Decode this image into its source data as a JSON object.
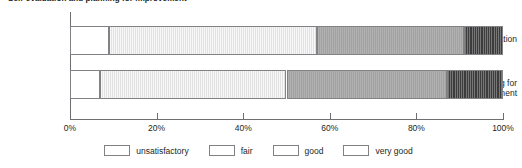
{
  "title_clipped": "Self-evaluation and planning for improvement",
  "axis": {
    "tick_labels": [
      "0%",
      "20%",
      "40%",
      "60%",
      "80%",
      "100%"
    ],
    "tick_values": [
      0,
      20,
      40,
      60,
      80,
      100
    ]
  },
  "legend": {
    "items": [
      {
        "label": "unsatisfactory",
        "key": "sw-unsatisfactory",
        "color": "#ffffff"
      },
      {
        "label": "fair",
        "key": "sw-fair",
        "color": "#e2e2e2"
      },
      {
        "label": "good",
        "key": "sw-good",
        "color": "#a2a2a2"
      },
      {
        "label": "very good",
        "key": "sw-verygood",
        "color": "#3c3c3c"
      }
    ]
  },
  "chart_data": {
    "type": "bar",
    "orientation": "horizontal",
    "stacked": true,
    "normalized_percent": true,
    "title": "Self-evaluation and planning for improvement",
    "xlabel": "",
    "ylabel": "",
    "xlim": [
      0,
      100
    ],
    "xticks": [
      0,
      20,
      40,
      60,
      80,
      100
    ],
    "xtick_labels": [
      "0%",
      "20%",
      "40%",
      "60%",
      "80%",
      "100%"
    ],
    "grid": false,
    "legend_position": "bottom",
    "categories": [
      "Self-evaluation",
      "Planning for improvement"
    ],
    "series": [
      {
        "name": "unsatisfactory",
        "color": "#ffffff",
        "values": [
          9,
          7
        ]
      },
      {
        "name": "fair",
        "color": "#e2e2e2",
        "values": [
          48,
          43
        ]
      },
      {
        "name": "good",
        "color": "#a2a2a2",
        "values": [
          34,
          37
        ]
      },
      {
        "name": "very good",
        "color": "#3c3c3c",
        "values": [
          9,
          13
        ]
      }
    ]
  }
}
